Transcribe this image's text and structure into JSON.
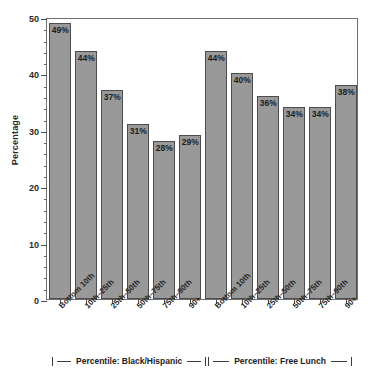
{
  "chart_data": {
    "type": "bar",
    "title": "",
    "xlabel": "",
    "ylabel": "Percentage",
    "ylim": [
      0,
      50
    ],
    "yticks": [
      0,
      10,
      20,
      30,
      40,
      50
    ],
    "ytick_labels": [
      "0",
      "10",
      "20",
      "30",
      "40",
      "50"
    ],
    "minor_tick_step": 2,
    "grid": false,
    "legend": "none",
    "bar_color": "#999999",
    "bar_edge_color": "#4d4d4d",
    "categories": [
      "Bottom 10th",
      "10th–25th",
      "25th–50th",
      "50th–75th",
      "75th–90th",
      "90+",
      "Bottom 10th",
      "10th–25th",
      "25th–50th",
      "50th–75th",
      "75th–90th",
      "90+"
    ],
    "values": [
      49,
      44,
      37,
      31,
      28,
      29,
      44,
      40,
      36,
      34,
      34,
      38
    ],
    "value_labels": [
      "49%",
      "44%",
      "37%",
      "31%",
      "28%",
      "29%",
      "44%",
      "40%",
      "36%",
      "34%",
      "34%",
      "38%"
    ],
    "groups": [
      {
        "label": "Percentile: Black/Hispanic",
        "start_index": 0,
        "end_index": 5
      },
      {
        "label": "Percentile: Free Lunch",
        "start_index": 6,
        "end_index": 11
      }
    ]
  }
}
